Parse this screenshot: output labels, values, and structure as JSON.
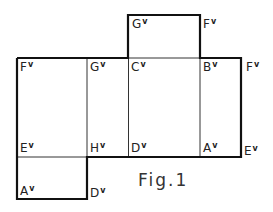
{
  "figure": {
    "caption": "Fig.1",
    "line_color": "#111111",
    "labels": [
      {
        "id": "top-g",
        "base": "G",
        "mark": "v",
        "x": 132,
        "y": 18
      },
      {
        "id": "top-f",
        "base": "F",
        "mark": "v",
        "x": 203,
        "y": 18
      },
      {
        "id": "row1-f",
        "base": "F",
        "mark": "v",
        "x": 20,
        "y": 61
      },
      {
        "id": "row1-g",
        "base": "G",
        "mark": "v",
        "x": 90,
        "y": 61
      },
      {
        "id": "row1-c",
        "base": "C",
        "mark": "v",
        "x": 131,
        "y": 61
      },
      {
        "id": "row1-b",
        "base": "B",
        "mark": "v",
        "x": 203,
        "y": 61
      },
      {
        "id": "row1-f-right",
        "base": "F",
        "mark": "v",
        "x": 246,
        "y": 61
      },
      {
        "id": "row2-e",
        "base": "E",
        "mark": "v",
        "x": 20,
        "y": 142
      },
      {
        "id": "row2-h",
        "base": "H",
        "mark": "v",
        "x": 90,
        "y": 142
      },
      {
        "id": "row2-d",
        "base": "D",
        "mark": "v",
        "x": 131,
        "y": 142
      },
      {
        "id": "row2-a",
        "base": "A",
        "mark": "v",
        "x": 203,
        "y": 142
      },
      {
        "id": "row2-e-right",
        "base": "E",
        "mark": "v",
        "x": 244,
        "y": 145
      },
      {
        "id": "bottom-a",
        "base": "A",
        "mark": "v",
        "x": 20,
        "y": 185
      },
      {
        "id": "bottom-d",
        "base": "D",
        "mark": "v",
        "x": 90,
        "y": 187
      }
    ]
  }
}
